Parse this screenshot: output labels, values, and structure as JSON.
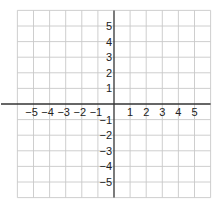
{
  "diagram": {
    "type": "coordinate-grid",
    "x_range": [
      -6,
      6
    ],
    "y_range": [
      -6,
      6
    ],
    "grid_color": "#c8c8c8",
    "axis_color": "#333333",
    "x_axis_labels": [
      {
        "value": -5,
        "text": "−5"
      },
      {
        "value": -4,
        "text": "−4"
      },
      {
        "value": -3,
        "text": "−3"
      },
      {
        "value": -2,
        "text": "−2"
      },
      {
        "value": -1,
        "text": "−1"
      },
      {
        "value": 1,
        "text": "1"
      },
      {
        "value": 2,
        "text": "2"
      },
      {
        "value": 3,
        "text": "3"
      },
      {
        "value": 4,
        "text": "4"
      },
      {
        "value": 5,
        "text": "5"
      }
    ],
    "y_axis_labels": [
      {
        "value": 5,
        "text": "5"
      },
      {
        "value": 4,
        "text": "4"
      },
      {
        "value": 3,
        "text": "3"
      },
      {
        "value": 2,
        "text": "2"
      },
      {
        "value": 1,
        "text": "1"
      },
      {
        "value": -1,
        "text": "−1"
      },
      {
        "value": -2,
        "text": "−2"
      },
      {
        "value": -3,
        "text": "−3"
      },
      {
        "value": -4,
        "text": "−4"
      },
      {
        "value": -5,
        "text": "−5"
      }
    ]
  }
}
